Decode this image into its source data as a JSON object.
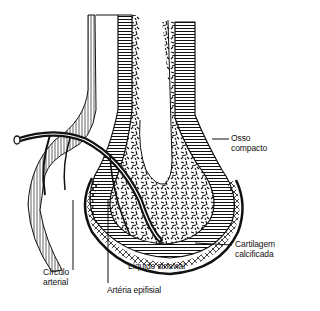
{
  "figure": {
    "labels": {
      "osso_compacto": [
        "Osso",
        "compacto"
      ],
      "cartilagem_calcificada": [
        "Cartilagem",
        "calcificada"
      ],
      "liquido_sinovial": "Líquido sinovial",
      "circulo_arterial": [
        "Círculo",
        "arterial"
      ],
      "arteria_epifisial": "Artéria epifisial"
    }
  }
}
